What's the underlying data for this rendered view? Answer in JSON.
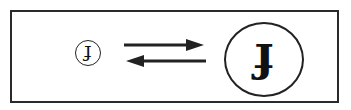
{
  "diagram": {
    "type": "equilibrium",
    "left_node": {
      "symbol": "f",
      "size": "small",
      "rotation": "180deg"
    },
    "right_node": {
      "symbol": "f",
      "size": "large",
      "rotation": "180deg"
    },
    "arrows": [
      {
        "direction": "forward",
        "from": "left_node",
        "to": "right_node"
      },
      {
        "direction": "reverse",
        "from": "right_node",
        "to": "left_node"
      }
    ],
    "colors": {
      "stroke": "#222222",
      "background": "#ffffff"
    }
  }
}
